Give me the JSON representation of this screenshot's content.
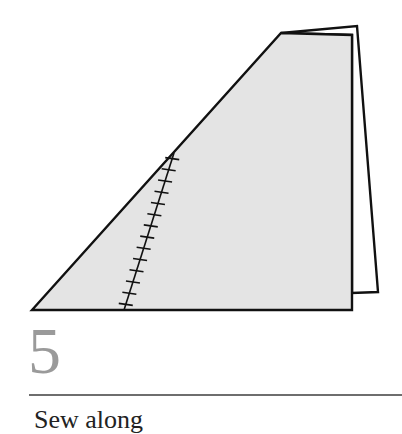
{
  "step": {
    "number": "5",
    "caption": "Sew along"
  },
  "figure": {
    "fill_color": "#e4e4e4",
    "stroke_color": "#111111",
    "number_color": "#9a9a9a"
  }
}
